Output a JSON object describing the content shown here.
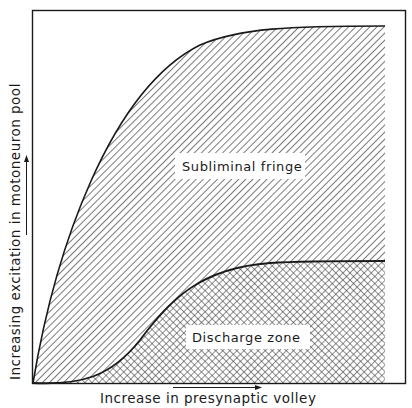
{
  "figure": {
    "xlabel": "Increase in presynaptic volley",
    "ylabel": "Increasing excitation in motoneuron pool",
    "regions": {
      "upper": {
        "label": "Subliminal fringe",
        "pattern": "diagonal-hatch"
      },
      "lower": {
        "label": "Discharge zone",
        "pattern": "cross-hatch"
      }
    },
    "colors": {
      "ink": "#1a1a1a",
      "background": "#ffffff"
    }
  }
}
